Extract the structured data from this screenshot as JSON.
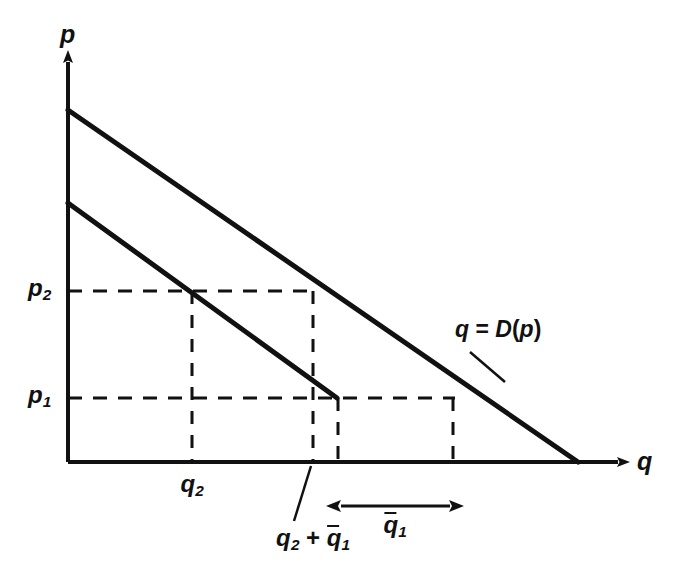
{
  "figure": {
    "width": 679,
    "height": 581,
    "background": "#ffffff",
    "ink_color": "#111111"
  },
  "axes": {
    "vertical": {
      "name": "price-axis",
      "label": "p",
      "x": 68,
      "y_top": 57,
      "y_bottom": 462
    },
    "horizontal": {
      "name": "quantity-axis",
      "label": "q",
      "y": 462,
      "x_left": 68,
      "x_right": 625
    },
    "origin": {
      "x": 68,
      "y": 462
    }
  },
  "tick_labels": {
    "p1": {
      "text": "p",
      "sub": "1",
      "x": 38,
      "y": 398
    },
    "p2": {
      "text": "p",
      "sub": "2",
      "x": 38,
      "y": 291
    },
    "q2": {
      "text": "q",
      "sub": "2",
      "x": 192,
      "y": 487
    }
  },
  "curves": [
    {
      "name": "demand-curve-original",
      "label": "q = D(p)",
      "from": {
        "x": 68,
        "y": 110
      },
      "to": {
        "x": 578,
        "y": 462
      },
      "stroke_width": 5
    },
    {
      "name": "demand-curve-shifted",
      "from": {
        "x": 68,
        "y": 203
      },
      "to": {
        "x": 337,
        "y": 398
      },
      "stroke_width": 5
    }
  ],
  "curve_label": {
    "text_q": "q",
    "text_eq": " = ",
    "text_D": "D",
    "text_open": "(",
    "text_p": "p",
    "text_close": ")",
    "full": "q = D(p)",
    "x": 478,
    "y": 330,
    "leader": {
      "x1": 470,
      "y1": 352,
      "x2": 505,
      "y2": 382
    }
  },
  "dashed_lines": {
    "horizontal": [
      {
        "name": "price-level-p2-guide",
        "y": 291,
        "x1": 68,
        "x2": 318
      },
      {
        "name": "price-level-p1-guide",
        "y": 398,
        "x1": 68,
        "x2": 455
      }
    ],
    "vertical": [
      {
        "name": "quantity-q2-guide",
        "x": 192,
        "y1": 291,
        "y2": 462
      },
      {
        "name": "quantity-q2-plus-qbar1-guide",
        "x": 313,
        "y1": 291,
        "y2": 462
      },
      {
        "name": "quantity-lower-endpoint-guide",
        "x": 338,
        "y1": 398,
        "y2": 462
      },
      {
        "name": "quantity-upper-endpoint-guide",
        "x": 453,
        "y1": 398,
        "y2": 462
      }
    ]
  },
  "segment_marker": {
    "name": "qbar1-span",
    "label_base": "q",
    "label_sub": "1",
    "label_full": "q̄₁",
    "x1": 338,
    "x2": 453,
    "y": 506,
    "label_x": 395,
    "label_y": 520
  },
  "annotations": {
    "q2_plus_qbar1": {
      "name": "q2-plus-qbar1-label",
      "base1": "q",
      "sub1": "2",
      "operator": " + ",
      "base2": "q",
      "sub2": "1",
      "full": "q₂ + q̄₁",
      "x": 313,
      "y": 533,
      "leader": {
        "x1": 311,
        "y1": 466,
        "x2": 295,
        "y2": 520
      }
    }
  }
}
